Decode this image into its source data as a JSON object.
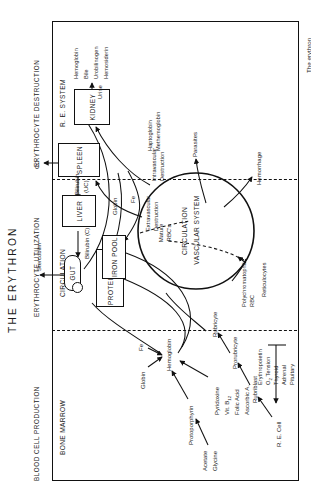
{
  "figure": {
    "title": "THE ERYTHRON",
    "caption": "The erythron",
    "sections": [
      {
        "key": "production",
        "header": "BLOOD CELL PRODUCTION",
        "subheader": "BONE MARROW"
      },
      {
        "key": "utilization",
        "header": "ERYTHROCYTE UTILIZATION",
        "subheader": "CIRCULATION"
      },
      {
        "key": "destruction",
        "header": "ERYTHROCYTE DESTRUCTION",
        "subheader": "R. E. SYSTEM"
      }
    ],
    "organs": [
      {
        "name": "GUT"
      },
      {
        "name": "LIVER"
      },
      {
        "name": "SPLEEN"
      },
      {
        "name": "KIDNEY"
      },
      {
        "name": "PROTEIN POOL"
      },
      {
        "name": "IRON POOL"
      }
    ],
    "circulation": {
      "line1": "CIRCULATION",
      "line2": "VASCULAR SYSTEM",
      "mature1": "Mature",
      "mature2": "RBC's",
      "poly1": "Polychromatophil",
      "poly2": "RBC",
      "retics": "Reticulocytes"
    },
    "marrow": {
      "acetate": "Acetate",
      "glycine": "Glycine",
      "protoporphyrin": "Protoporphyrin",
      "globin": "Globin",
      "fe": "Fe",
      "hemoglobin": "Hemoglobin",
      "pyridoxine": "Pyridoxine",
      "vitb12": "Vit. B",
      "vitb12sub": "12",
      "folic": "Folic Acid",
      "ascorbic": "Ascorbic A.",
      "rubriblast": "Rubriblast",
      "prorubricyte": "Prorubricyte",
      "rubricyte": "Rubricyte",
      "recell": "R. E. Cell",
      "stimuli": [
        "Erythropoietin",
        "O  Tension",
        "Thyroid",
        "Adrenal",
        "Pituitary"
      ],
      "o2sub": "2"
    },
    "destruction": {
      "stercobilin": "Stercobilin",
      "bilirubin_c": "Bilirubin (C)",
      "bilirubin_uc1": "Bilirubin",
      "bilirubin_uc2": "(UC)",
      "co": "CO",
      "globin": "Globin",
      "fe": "Fe",
      "extravascular1": "Extravascular",
      "extravascular2": "Destruction",
      "intravascular1": "Intravascular",
      "intravascular2": "Destruction",
      "haptoglobin": "Haptoglobin",
      "methemoglobin": "Methemoglobin",
      "urine": "Urine",
      "kidney_outputs": [
        "Hemoglobin",
        "Bile",
        "Urobilinogen",
        "Hemosiderin"
      ]
    },
    "losses": {
      "hemorrhage": "Hemorrhage",
      "parasites": "Parasites"
    },
    "colors": {
      "ink": "#111111",
      "paper": "#ffffff"
    }
  }
}
